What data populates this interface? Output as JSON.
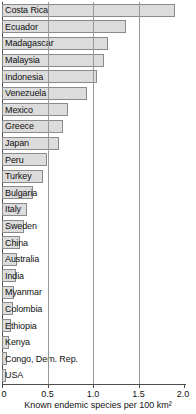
{
  "chart_data": {
    "type": "bar",
    "orientation": "horizontal",
    "title": "",
    "xlabel": "Known endemic species per 100 km²",
    "ylabel": "",
    "xlim": [
      0,
      2.0
    ],
    "xticks": [
      0,
      0.5,
      1.0,
      1.5,
      2.0
    ],
    "xtick_labels": [
      "0",
      "0.5",
      "1.0",
      "1.5",
      "2.0"
    ],
    "gridlines": [
      0.5,
      1.0,
      1.5
    ],
    "grid": true,
    "legend": false,
    "categories": [
      "Costa Rica",
      "Ecuador",
      "Madagascar",
      "Malaysia",
      "Indonesia",
      "Venezuela",
      "Mexico",
      "Greece",
      "Japan",
      "Peru",
      "Turkey",
      "Bulgaria",
      "Italy",
      "Sweden",
      "China",
      "Australia",
      "India",
      "Myanmar",
      "Colombia",
      "Ethiopia",
      "Kenya",
      "Congo, Dem. Rep.",
      "USA"
    ],
    "values": [
      1.9,
      1.36,
      1.16,
      1.12,
      1.04,
      0.93,
      0.73,
      0.67,
      0.63,
      0.49,
      0.45,
      0.34,
      0.28,
      0.24,
      0.2,
      0.17,
      0.15,
      0.13,
      0.12,
      0.1,
      0.08,
      0.06,
      0.04
    ],
    "bar_color": "#dcdcdc",
    "bar_edge_color": "#8a8a8a",
    "axis_color": "#4d4d4d",
    "grid_color": "#9a9a9a",
    "background": "#ffffff"
  }
}
